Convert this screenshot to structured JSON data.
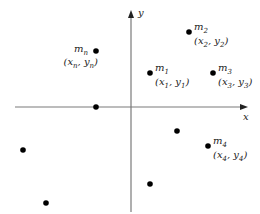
{
  "axes": {
    "x_label": "x",
    "y_label": "y",
    "origin_px": [
      131,
      107
    ],
    "x_range_px": [
      15,
      247
    ],
    "y_range_px": [
      212,
      10
    ]
  },
  "labeled_points": [
    {
      "id": "m2",
      "mass": "m",
      "mass_sub": "2",
      "coord_x": "x",
      "coord_x_sub": "2",
      "coord_y": "y",
      "coord_y_sub": "2",
      "px": [
        189,
        32
      ],
      "label_side": "right"
    },
    {
      "id": "m1",
      "mass": "m",
      "mass_sub": "1",
      "coord_x": "x",
      "coord_x_sub": "1",
      "coord_y": "y",
      "coord_y_sub": "1",
      "px": [
        150,
        73
      ],
      "label_side": "right"
    },
    {
      "id": "m3",
      "mass": "m",
      "mass_sub": "3",
      "coord_x": "x",
      "coord_x_sub": "3",
      "coord_y": "y",
      "coord_y_sub": "3",
      "px": [
        213,
        73
      ],
      "label_side": "right"
    },
    {
      "id": "mn",
      "mass": "m",
      "mass_sub": "n",
      "coord_x": "x",
      "coord_x_sub": "n",
      "coord_y": "y",
      "coord_y_sub": "n",
      "px": [
        96,
        51
      ],
      "label_side": "left"
    },
    {
      "id": "m4",
      "mass": "m",
      "mass_sub": "4",
      "coord_x": "x",
      "coord_x_sub": "4",
      "coord_y": "y",
      "coord_y_sub": "4",
      "px": [
        208,
        146
      ],
      "label_side": "right"
    }
  ],
  "unlabeled_points": [
    {
      "px": [
        96,
        107
      ]
    },
    {
      "px": [
        177,
        131
      ]
    },
    {
      "px": [
        150,
        184
      ]
    },
    {
      "px": [
        23,
        150
      ]
    },
    {
      "px": [
        46,
        203
      ]
    }
  ],
  "colors": {
    "axis": "#7a7a7a",
    "dot": "#000000",
    "text": "#222222"
  }
}
